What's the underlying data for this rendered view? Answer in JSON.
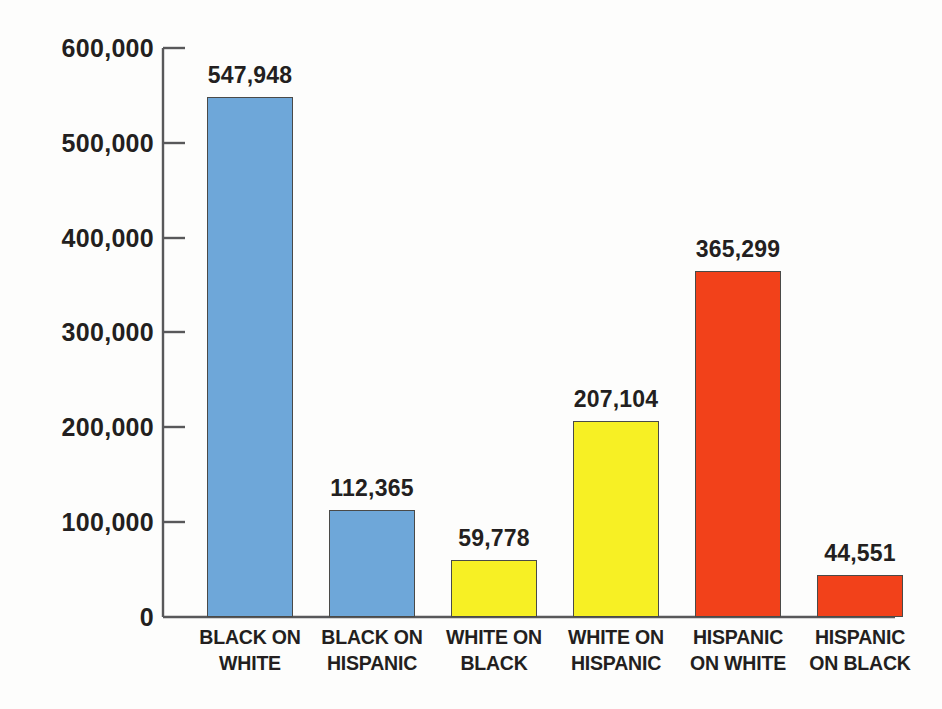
{
  "chart_data": {
    "type": "bar",
    "title": "",
    "subtitle": "",
    "xlabel": "",
    "ylabel": "",
    "ylim": [
      0,
      600000
    ],
    "grid": false,
    "legend": "none",
    "y_ticks": [
      "0",
      "100,000",
      "200,000",
      "300,000",
      "400,000",
      "500,000",
      "600,000"
    ],
    "y_tick_values": [
      0,
      100000,
      200000,
      300000,
      400000,
      500000,
      600000
    ],
    "categories": [
      "BLACK ON WHITE",
      "BLACK ON HISPANIC",
      "WHITE ON BLACK",
      "WHITE ON HISPANIC",
      "HISPANIC ON WHITE",
      "HISPANIC ON BLACK"
    ],
    "category_lines": [
      [
        "BLACK ON",
        "WHITE"
      ],
      [
        "BLACK ON",
        "HISPANIC"
      ],
      [
        "WHITE ON",
        "BLACK"
      ],
      [
        "WHITE ON",
        "HISPANIC"
      ],
      [
        "HISPANIC",
        "ON WHITE"
      ],
      [
        "HISPANIC",
        "ON BLACK"
      ]
    ],
    "values": [
      547948,
      112365,
      59778,
      207104,
      365299,
      44551
    ],
    "value_labels": [
      "547,948",
      "112,365",
      "59,778",
      "207,104",
      "365,299",
      "44,551"
    ],
    "bar_colors": [
      "#6ea7d9",
      "#6ea7d9",
      "#f7f024",
      "#f7f024",
      "#f2411a",
      "#f2411a"
    ],
    "bar_border_color": "#4a4a48",
    "axis_color": "#58585a",
    "background_color": "#fdfdfc",
    "text_color": "#231f20"
  }
}
